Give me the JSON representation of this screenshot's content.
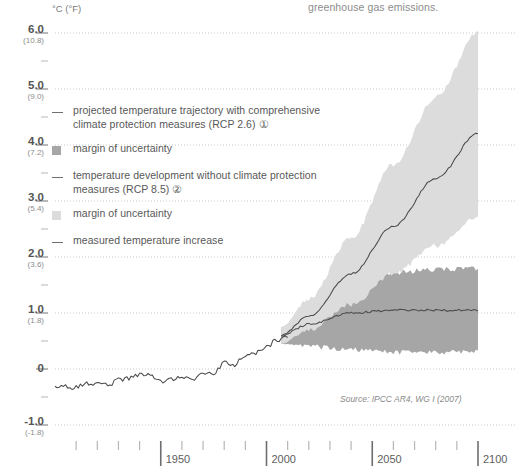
{
  "caption": {
    "trailing_text": "greenhouse gas emissions."
  },
  "axis": {
    "unit_label": "°C (°F)",
    "y_ticks": [
      {
        "c": "6.0",
        "f": "(10.8)",
        "value": 6.0
      },
      {
        "c": "5.0",
        "f": "(9.0)",
        "value": 5.0
      },
      {
        "c": "4.0",
        "f": "(7.2)",
        "value": 4.0
      },
      {
        "c": "3.0",
        "f": "(5.4)",
        "value": 3.0
      },
      {
        "c": "2.0",
        "f": "(3.6)",
        "value": 2.0
      },
      {
        "c": "1.0",
        "f": "(1.8)",
        "value": 1.0
      },
      {
        "c": "0",
        "f": "",
        "value": 0
      },
      {
        "c": "-1.0",
        "f": "(-1.8)",
        "value": -1.0
      }
    ],
    "x_major": [
      "1950",
      "2000",
      "2050",
      "2100"
    ],
    "x_minor_step_years": 10
  },
  "legend": {
    "items": [
      {
        "mark": "line",
        "label": "projected temperature trajectory with comprehensive climate protection measures (RCP 2.6) ①"
      },
      {
        "mark": "swatch-dark",
        "label": "margin of uncertainty"
      },
      {
        "mark": "line",
        "label": "temperature development without climate protection measures (RCP 8.5) ②"
      },
      {
        "mark": "swatch-light",
        "label": "margin of uncertainty"
      },
      {
        "mark": "line",
        "label": "measured temperature increase"
      }
    ]
  },
  "source": {
    "text": "Source: IPCC AR4, WG I (2007)"
  },
  "colors": {
    "band_rcp26": "#a6a6a6",
    "band_rcp85": "#dcdcdc",
    "line": "#4a4a4a",
    "grid": "#c9c9c9",
    "axis": "#8a8a8a",
    "text": "#5a5a5a"
  },
  "chart_data": {
    "type": "line",
    "title": "",
    "subtitle": "",
    "xlabel": "",
    "ylabel": "°C (°F)",
    "xlim": [
      1900,
      2100
    ],
    "ylim": [
      -1.3,
      6.4
    ],
    "grid": true,
    "legend_position": "inside-upper-left",
    "annotations": [
      "Source: IPCC AR4, WG I (2007)"
    ],
    "series": [
      {
        "name": "measured temperature increase",
        "type": "line",
        "x": [
          1900,
          1905,
          1910,
          1915,
          1920,
          1925,
          1930,
          1935,
          1940,
          1945,
          1950,
          1955,
          1960,
          1965,
          1970,
          1975,
          1980,
          1985,
          1990,
          1995,
          2000,
          2005,
          2010
        ],
        "values": [
          -0.3,
          -0.32,
          -0.33,
          -0.27,
          -0.26,
          -0.28,
          -0.2,
          -0.17,
          -0.1,
          -0.12,
          -0.22,
          -0.18,
          -0.12,
          -0.2,
          -0.1,
          -0.08,
          0.1,
          0.08,
          0.25,
          0.28,
          0.4,
          0.52,
          0.58
        ]
      },
      {
        "name": "projected temperature trajectory with comprehensive climate protection measures (RCP 2.6)",
        "type": "line",
        "x": [
          2007,
          2020,
          2040,
          2060,
          2080,
          2100
        ],
        "values": [
          0.6,
          0.8,
          1.0,
          1.05,
          1.05,
          1.05
        ]
      },
      {
        "name": "temperature development without climate protection measures (RCP 8.5)",
        "type": "line",
        "x": [
          2007,
          2020,
          2040,
          2060,
          2080,
          2100
        ],
        "values": [
          0.6,
          0.95,
          1.7,
          2.55,
          3.4,
          4.2
        ]
      }
    ],
    "bands": [
      {
        "name": "margin of uncertainty (RCP 2.6)",
        "x": [
          2007,
          2020,
          2040,
          2060,
          2080,
          2100
        ],
        "lower": [
          0.45,
          0.4,
          0.35,
          0.3,
          0.3,
          0.3
        ],
        "upper": [
          0.75,
          1.15,
          1.55,
          1.72,
          1.78,
          1.8
        ],
        "color": "#a6a6a6"
      },
      {
        "name": "margin of uncertainty (RCP 8.5)",
        "x": [
          2007,
          2020,
          2040,
          2060,
          2080,
          2100
        ],
        "lower": [
          0.45,
          0.7,
          1.15,
          1.7,
          2.2,
          2.7
        ],
        "upper": [
          0.75,
          1.25,
          2.35,
          3.65,
          4.85,
          6.0
        ],
        "color": "#dcdcdc"
      }
    ]
  }
}
